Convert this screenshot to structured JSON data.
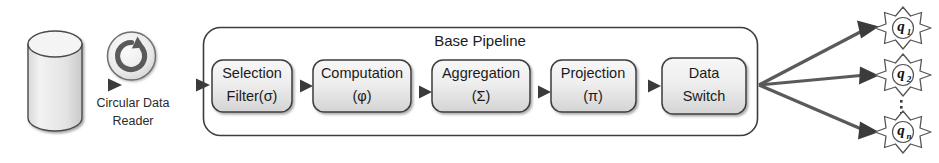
{
  "diagram": {
    "source": {
      "name": "data-store-cylinder",
      "icon": "database-cylinder-icon",
      "label": ""
    },
    "reader": {
      "icon": "circular-arrow-icon",
      "label_line1": "Circular Data",
      "label_line2": "Reader"
    },
    "pipeline": {
      "title": "Base Pipeline",
      "stages": [
        {
          "id": "selection-filter",
          "line1": "Selection",
          "line2": "Filter(σ)"
        },
        {
          "id": "computation",
          "line1": "Computation",
          "line2": "(φ)"
        },
        {
          "id": "aggregation",
          "line1": "Aggregation",
          "line2": "(Σ)"
        },
        {
          "id": "projection",
          "line1": "Projection",
          "line2": "(π)"
        },
        {
          "id": "data-switch",
          "line1": "Data",
          "line2": "Switch"
        }
      ]
    },
    "outputs": [
      {
        "id": "q1",
        "label": "q",
        "sub": "1"
      },
      {
        "id": "q2",
        "label": "q",
        "sub": "2"
      },
      {
        "id": "qn",
        "label": "q",
        "sub": "n"
      }
    ],
    "ellipsis": "⋮",
    "colors": {
      "stroke": "#3d3d3d",
      "box_fill_top": "#f2f2f2",
      "box_fill_bottom": "#d9d9d9",
      "arrow": "#4a4a4a",
      "text": "#1b1b1b"
    }
  }
}
